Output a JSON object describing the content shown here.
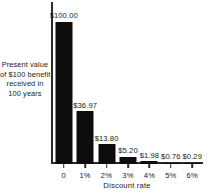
{
  "chart_data": {
    "type": "bar",
    "title": "",
    "subtitle": "",
    "xlabel": "Discount rate",
    "ylabel": "Present value of $100 benefit received in 100 years",
    "ylabel_lines": [
      "Present value",
      "of $100 benefit",
      "received in",
      "100 years"
    ],
    "categories": [
      "0",
      "1%",
      "2%",
      "3%",
      "4%",
      "5%",
      "6%"
    ],
    "values": [
      100.0,
      36.97,
      13.8,
      5.2,
      1.98,
      0.76,
      0.29
    ],
    "data_labels": [
      "$100.00",
      "$36.97",
      "$13.80",
      "$5.20",
      "$1.98",
      "$0.76",
      "$0.29"
    ],
    "ylim": [
      0,
      114
    ],
    "grid": false,
    "legend": false,
    "bar_color": "#0d0d0d",
    "axis_color": "#2b2b2b",
    "background_color": "#ffffff"
  }
}
